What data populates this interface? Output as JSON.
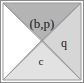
{
  "figure": {
    "type": "quadrant-square-diagram",
    "width": 84,
    "height": 83,
    "background_color": "#fdfdfd",
    "frame": {
      "stroke_color": "#8d8d8d",
      "stroke_width": 1
    },
    "geometry": {
      "square": {
        "x": 3,
        "y": 3,
        "width": 78,
        "height": 77
      },
      "crossing_point": {
        "x": 42,
        "y": 40
      },
      "diagonal_stroke_color": "#9a9a9a",
      "diagonal_stroke_width": 1
    },
    "regions": [
      {
        "id": "top",
        "name": "top-triangle",
        "label": "(b,p)",
        "fill_color": "#b4b4b4",
        "label_x": 42,
        "label_y": 25,
        "font_size": 13,
        "has_label": true
      },
      {
        "id": "right",
        "name": "right-triangle",
        "label": "q",
        "fill_color": "#d6d6d6",
        "label_x": 64,
        "label_y": 44,
        "font_size": 12,
        "has_label": true
      },
      {
        "id": "bottom",
        "name": "bottom-triangle",
        "label": "c",
        "fill_color": "#e2e2e2",
        "label_x": 41,
        "label_y": 62,
        "font_size": 11,
        "has_label": true
      },
      {
        "id": "left",
        "name": "left-triangle",
        "label": "",
        "fill_color": "#ffffff",
        "label_x": 19,
        "label_y": 44,
        "font_size": 11,
        "has_label": false
      }
    ]
  }
}
